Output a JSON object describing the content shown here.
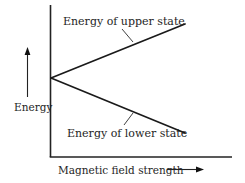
{
  "diagram": {
    "type": "energy-level-splitting",
    "colors": {
      "background": "#ffffff",
      "ink": "#1a1a1a"
    },
    "axes": {
      "x_label": "Magnetic field strength",
      "y_label": "Energy",
      "x_arrow": "right-arrow",
      "y_arrow": "up-arrow"
    },
    "lines": [
      {
        "name": "upper-state",
        "label": "Energy of upper state",
        "direction": "increasing"
      },
      {
        "name": "lower-state",
        "label": "Energy of lower state",
        "direction": "decreasing"
      }
    ]
  }
}
